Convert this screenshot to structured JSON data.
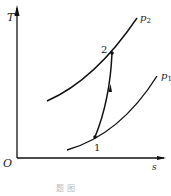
{
  "diagram": {
    "type": "T-s diagram",
    "axes": {
      "y_label": "T",
      "x_label": "s",
      "origin_label": "O"
    },
    "isobars": [
      {
        "label": "p",
        "sub": "2"
      },
      {
        "label": "p",
        "sub": "1"
      }
    ],
    "points": [
      {
        "label": "1"
      },
      {
        "label": "2"
      }
    ],
    "process": "1 → 2 compression (arrow pointing up)",
    "caption": "题 图"
  }
}
